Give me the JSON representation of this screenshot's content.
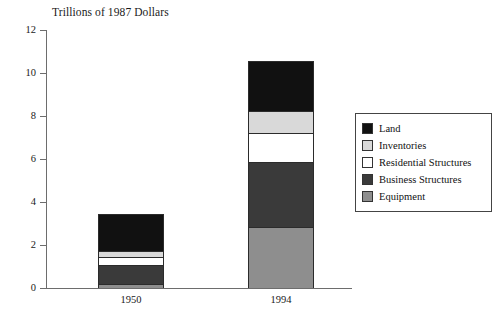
{
  "chart_data": {
    "type": "bar",
    "subtype": "stacked",
    "title": "Trillions of 1987 Dollars",
    "xlabel": "",
    "ylabel": "",
    "categories": [
      "1950",
      "1994"
    ],
    "ylim": [
      0,
      12
    ],
    "yticks": [
      0,
      2,
      4,
      6,
      8,
      10,
      12
    ],
    "ytick_labels": [
      "0",
      "2",
      "4",
      "6",
      "8",
      "10",
      "12"
    ],
    "grid": false,
    "legend_position": "right",
    "series": [
      {
        "name": "Equipment",
        "color": "#8e8e8e",
        "values": [
          0.2,
          2.95
        ]
      },
      {
        "name": "Business Structures",
        "color": "#3a3a3a",
        "values": [
          0.85,
          3.15
        ]
      },
      {
        "name": "Residential Structures",
        "color": "#ffffff",
        "values": [
          0.4,
          1.45
        ]
      },
      {
        "name": "Inventories",
        "color": "#d9d9d9",
        "values": [
          0.25,
          1.07
        ]
      },
      {
        "name": "Land",
        "color": "#111111",
        "values": [
          1.75,
          2.4
        ]
      }
    ],
    "totals": [
      3.45,
      10.55
    ]
  },
  "legend": {
    "items": [
      {
        "label": "Land",
        "swatch": "#111111"
      },
      {
        "label": "Inventories",
        "swatch": "#d9d9d9"
      },
      {
        "label": "Residential Structures",
        "swatch": "#ffffff"
      },
      {
        "label": "Business Structures",
        "swatch": "#3a3a3a"
      },
      {
        "label": "Equipment",
        "swatch": "#8e8e8e"
      }
    ]
  }
}
